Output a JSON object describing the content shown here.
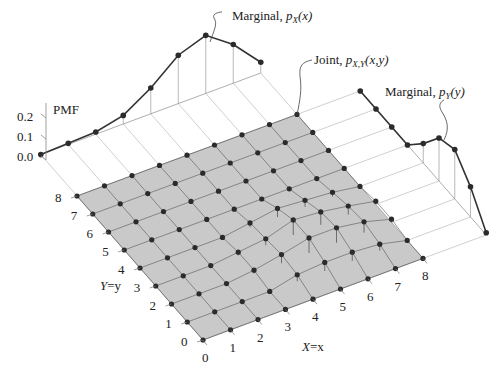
{
  "chart_data": {
    "type": "3d-stem-pmf",
    "title": "",
    "zlabel": "PMF",
    "xlabel": "X=x",
    "ylabel": "Y=y",
    "z_ticks": [
      "0.0",
      "0.1",
      "0.2"
    ],
    "x_ticks": [
      "0",
      "1",
      "2",
      "3",
      "4",
      "5",
      "6",
      "7",
      "8"
    ],
    "y_ticks": [
      "0",
      "1",
      "2",
      "3",
      "4",
      "5",
      "6",
      "7",
      "8"
    ],
    "annotations": {
      "marginal_x": "Marginal, p_X(x)",
      "joint": "Joint, p_X,Y(x,y)",
      "marginal_y": "Marginal, p_Y(y)"
    },
    "marginal_x": {
      "x": [
        0,
        1,
        2,
        3,
        4,
        5,
        6,
        7,
        8
      ],
      "values": [
        0.0,
        0.005,
        0.01,
        0.04,
        0.12,
        0.225,
        0.27,
        0.18,
        0.05
      ]
    },
    "marginal_y": {
      "y": [
        0,
        1,
        2,
        3,
        4,
        5,
        6,
        7,
        8
      ],
      "values": [
        0.01,
        0.14,
        0.23,
        0.2,
        0.09,
        0.0,
        0.0,
        0.0,
        0.0
      ]
    },
    "joint_nonzero": [
      {
        "x": 4,
        "y": 1,
        "p": 0.03
      },
      {
        "x": 4,
        "y": 2,
        "p": 0.04
      },
      {
        "x": 4,
        "y": 3,
        "p": 0.03
      },
      {
        "x": 4,
        "y": 4,
        "p": 0.02
      },
      {
        "x": 5,
        "y": 1,
        "p": 0.04
      },
      {
        "x": 5,
        "y": 2,
        "p": 0.07
      },
      {
        "x": 5,
        "y": 3,
        "p": 0.07
      },
      {
        "x": 5,
        "y": 4,
        "p": 0.04
      },
      {
        "x": 6,
        "y": 1,
        "p": 0.04
      },
      {
        "x": 6,
        "y": 2,
        "p": 0.07
      },
      {
        "x": 6,
        "y": 3,
        "p": 0.06
      },
      {
        "x": 6,
        "y": 4,
        "p": 0.03
      },
      {
        "x": 7,
        "y": 1,
        "p": 0.03
      },
      {
        "x": 7,
        "y": 2,
        "p": 0.05
      },
      {
        "x": 7,
        "y": 3,
        "p": 0.04
      },
      {
        "x": 7,
        "y": 4,
        "p": 0.02
      },
      {
        "x": 3,
        "y": 2,
        "p": 0.015
      },
      {
        "x": 3,
        "y": 3,
        "p": 0.015
      },
      {
        "x": 8,
        "y": 2,
        "p": 0.015
      },
      {
        "x": 8,
        "y": 3,
        "p": 0.015
      }
    ],
    "colors": {
      "surface": "#c9c9c9",
      "grid": "#555555",
      "marker": "#2b2b2b",
      "curve": "#333333",
      "guide": "#bbbbbb"
    }
  },
  "labels": {
    "pmf": "PMF",
    "z0": "0.0",
    "z1": "0.1",
    "z2": "0.2",
    "xaxis_pre": "X",
    "xaxis_post": "=x",
    "yaxis_pre": "Y",
    "yaxis_post": "=y",
    "marg_x_text": "Marginal, ",
    "marg_x_p": "p",
    "marg_x_sub": "X",
    "marg_x_arg": "(x)",
    "joint_text": "Joint, ",
    "joint_p": "p",
    "joint_sub": "X,Y",
    "joint_arg": "(x,y)",
    "marg_y_text": "Marginal, ",
    "marg_y_p": "p",
    "marg_y_sub": "Y",
    "marg_y_arg": "(y)"
  }
}
